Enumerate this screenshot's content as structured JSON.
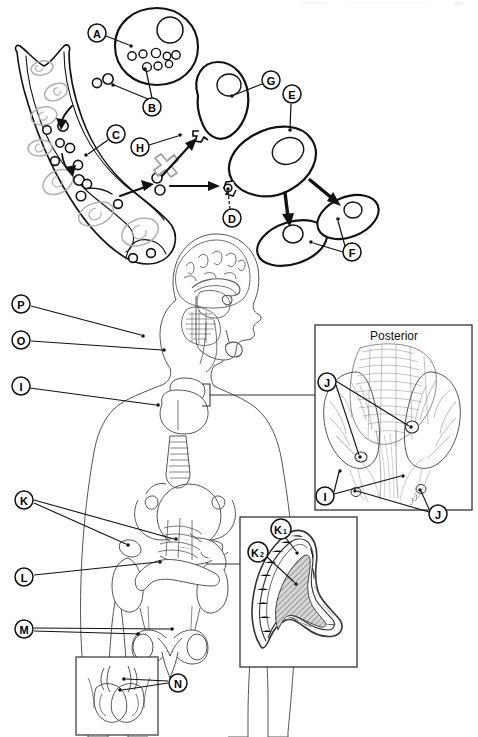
{
  "figure": {
    "background_color": "#ffffff",
    "ink_color": "#000000",
    "light_ink_color": "#9a9a9a",
    "panels": [
      {
        "id": "panel-top",
        "name": "bone-remodeling-cell-lineage-diagram",
        "description": "Bone matrix with lacunae at left; precursor cells migrating out; a large round cell at upper middle; chain of oval cells at right connected by arrows; a blocked pathway marked with a grey X.",
        "labels": [
          {
            "key": "A",
            "text": "A",
            "cx": 97,
            "cy": 33,
            "tip_x": 131,
            "tip_y": 46
          },
          {
            "key": "B",
            "text": "B",
            "cx": 152,
            "cy": 107,
            "tip_x": 113,
            "tip_y": 85
          },
          {
            "key": "B2",
            "text": "B",
            "cx": 152,
            "cy": 107,
            "tip_x": 145,
            "tip_y": 69
          },
          {
            "key": "C",
            "text": "C",
            "cx": 116,
            "cy": 134,
            "tip_x": 86,
            "tip_y": 155
          },
          {
            "key": "D",
            "text": "D",
            "cx": 232,
            "cy": 218,
            "tip_x": 228,
            "tip_y": 188
          },
          {
            "key": "E",
            "text": "E",
            "cx": 292,
            "cy": 94,
            "tip_x": 290,
            "tip_y": 130
          },
          {
            "key": "F",
            "text": "F",
            "cx": 352,
            "cy": 252,
            "tip_x": 311,
            "tip_y": 242
          },
          {
            "key": "F2",
            "text": "F",
            "cx": 352,
            "cy": 252,
            "tip_x": 338,
            "tip_y": 219
          },
          {
            "key": "G",
            "text": "G",
            "cx": 271,
            "cy": 80,
            "tip_x": 232,
            "tip_y": 96
          },
          {
            "key": "H",
            "text": "H",
            "cx": 140,
            "cy": 147,
            "tip_x": 180,
            "tip_y": 135
          }
        ]
      },
      {
        "id": "panel-bottom",
        "name": "endocrine-system-overview",
        "description": "Female body outline, midsagittal head with brain, thyroid and trachea, breasts, kidneys with adrenal glands, pancreas, ovaries and uterus; three inset boxes.",
        "labels": [
          {
            "key": "P",
            "text": "P",
            "cx": 21,
            "cy": 304,
            "tip_x": 143,
            "tip_y": 336
          },
          {
            "key": "O",
            "text": "O",
            "cx": 21,
            "cy": 340,
            "tip_x": 164,
            "tip_y": 350
          },
          {
            "key": "I",
            "text": "I",
            "cx": 21,
            "cy": 386,
            "tip_x": 158,
            "tip_y": 405
          },
          {
            "key": "K",
            "text": "K",
            "cx": 24,
            "cy": 500,
            "tip_x": 128,
            "tip_y": 545
          },
          {
            "key": "K2",
            "text": "K",
            "cx": 24,
            "cy": 500,
            "tip_x": 176,
            "tip_y": 539
          },
          {
            "key": "L",
            "text": "L",
            "cx": 24,
            "cy": 577,
            "tip_x": 160,
            "tip_y": 562
          },
          {
            "key": "M",
            "text": "M",
            "cx": 24,
            "cy": 629,
            "tip_x": 172,
            "tip_y": 629
          },
          {
            "key": "M2",
            "text": "M",
            "cx": 24,
            "cy": 629,
            "tip_x": 142,
            "tip_y": 633
          },
          {
            "key": "N",
            "text": "N",
            "cx": 178,
            "cy": 683,
            "tip_x": 120,
            "tip_y": 690
          },
          {
            "key": "N2",
            "text": "N",
            "cx": 178,
            "cy": 683,
            "tip_x": 124,
            "tip_y": 679
          }
        ],
        "insets": [
          {
            "id": "inset-posterior",
            "name": "posterior-thyroid-parathyroid-inset",
            "title": "Posterior",
            "x": 315,
            "y": 325,
            "w": 157,
            "h": 185,
            "labels": [
              {
                "key": "J",
                "text": "J",
                "cx": 327,
                "cy": 382,
                "tip_x": 361,
                "tip_y": 457
              },
              {
                "key": "J1",
                "text": "J",
                "cx": 327,
                "cy": 382,
                "tip_x": 411,
                "tip_y": 427
              },
              {
                "key": "I",
                "text": "I",
                "cx": 325,
                "cy": 496,
                "tip_x": 340,
                "tip_y": 471
              },
              {
                "key": "I2",
                "text": "I",
                "cx": 325,
                "cy": 496,
                "tip_x": 403,
                "tip_y": 476
              },
              {
                "key": "J2",
                "text": "J",
                "cx": 438,
                "cy": 514,
                "tip_x": 355,
                "tip_y": 492
              },
              {
                "key": "J3",
                "text": "J",
                "cx": 438,
                "cy": 514,
                "tip_x": 420,
                "tip_y": 490
              }
            ]
          },
          {
            "id": "inset-adrenal",
            "name": "adrenal-gland-cross-section-inset",
            "title": "",
            "x": 240,
            "y": 517,
            "w": 117,
            "h": 150,
            "labels": [
              {
                "key": "K1",
                "text": "K",
                "sub": "1",
                "cx": 281,
                "cy": 529,
                "tip_x": 298,
                "tip_y": 553
              },
              {
                "key": "K2",
                "text": "K",
                "sub": "2",
                "cx": 258,
                "cy": 552,
                "tip_x": 296,
                "tip_y": 584
              }
            ]
          },
          {
            "id": "inset-testes",
            "name": "testes-inset",
            "title": "",
            "x": 76,
            "y": 657,
            "w": 82,
            "h": 78,
            "labels": []
          }
        ]
      }
    ]
  }
}
